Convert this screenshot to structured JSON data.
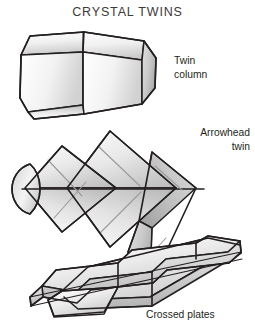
{
  "page": {
    "title": "CRYSTAL TWINS",
    "background_color": "#ffffff",
    "ink_color": "#231f20",
    "title_color": "#3a3a3a",
    "shade_light": "#fdfdfd",
    "shade_mid": "#dcdcdc",
    "shade_dark": "#b2b2b2",
    "striation_color": "#9a9a9a"
  },
  "figures": [
    {
      "id": "twin-column",
      "label": "Twin\ncolumn",
      "description": "hexagonal prism crystal split into two twinned halves"
    },
    {
      "id": "arrowhead-twin",
      "label": "Arrowhead\ntwin",
      "description": "three interpenetrating arrowhead shaped crystals on a common axis with rounded left end cap"
    },
    {
      "id": "crossed-plates",
      "label": "Crossed plates",
      "description": "two elongated tabular plate crystals crossing each other"
    }
  ]
}
